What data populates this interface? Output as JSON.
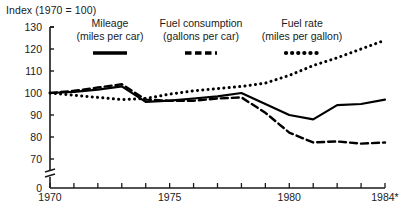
{
  "chart": {
    "title": "Index (1970 = 100)",
    "xlabel": "",
    "ylabel": "",
    "footnote_marker": "*"
  },
  "axis": {
    "y_ticks": [
      "130",
      "120",
      "110",
      "100",
      "90",
      "80",
      "70",
      "0"
    ],
    "x_ticks": [
      "1970",
      "1975",
      "1980",
      "1984*"
    ]
  },
  "legend": {
    "items": [
      {
        "name": "Mileage",
        "unit": "(miles per car)",
        "style": "solid",
        "color": "#000000"
      },
      {
        "name": "Fuel consumption",
        "unit": "(gallons per car)",
        "style": "dashed",
        "color": "#000000"
      },
      {
        "name": "Fuel rate",
        "unit": "(miles per gallon)",
        "style": "dotted",
        "color": "#000000"
      }
    ]
  },
  "chart_data": {
    "type": "line",
    "title": "Index (1970 = 100)",
    "xlabel": "",
    "ylabel": "Index (1970 = 100)",
    "x": [
      1970,
      1971,
      1972,
      1973,
      1974,
      1975,
      1976,
      1977,
      1978,
      1979,
      1980,
      1981,
      1982,
      1983,
      1984
    ],
    "xlim": [
      1970,
      1984
    ],
    "ylim": [
      70,
      130
    ],
    "y_break_below": 70,
    "grid": false,
    "legend_position": "top",
    "series": [
      {
        "name": "Mileage",
        "unit": "miles per car",
        "style": "solid",
        "values": [
          100,
          100.5,
          101.5,
          103,
          96,
          96.5,
          97.5,
          98.5,
          100,
          95,
          90,
          88,
          94.5,
          95,
          97
        ]
      },
      {
        "name": "Fuel consumption",
        "unit": "gallons per car",
        "style": "dashed",
        "values": [
          100,
          101,
          102.5,
          104,
          97,
          96.5,
          96.5,
          97.5,
          98,
          91,
          82,
          77.5,
          78,
          77,
          77.5
        ]
      },
      {
        "name": "Fuel rate",
        "unit": "miles per gallon",
        "style": "dotted",
        "values": [
          100,
          99,
          98,
          97,
          97.5,
          99.5,
          101,
          102,
          103,
          104.5,
          108,
          112.5,
          116,
          120,
          124
        ]
      }
    ]
  }
}
